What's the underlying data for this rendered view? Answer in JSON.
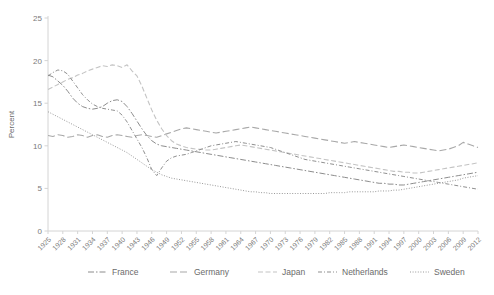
{
  "chart_data": {
    "type": "line",
    "title": "",
    "subtitle": "",
    "xlabel": "",
    "ylabel": "Percent",
    "ylim": [
      0,
      25
    ],
    "yticks": [
      0,
      5,
      10,
      15,
      20,
      25
    ],
    "xlim": [
      1925,
      2012
    ],
    "grid": false,
    "legend_position": "bottom",
    "x": [
      1925,
      1926,
      1927,
      1928,
      1929,
      1930,
      1931,
      1932,
      1933,
      1934,
      1935,
      1936,
      1937,
      1938,
      1939,
      1940,
      1941,
      1942,
      1943,
      1944,
      1945,
      1946,
      1947,
      1948,
      1949,
      1950,
      1951,
      1952,
      1953,
      1954,
      1955,
      1956,
      1957,
      1958,
      1959,
      1960,
      1961,
      1962,
      1963,
      1964,
      1965,
      1966,
      1967,
      1968,
      1969,
      1970,
      1971,
      1972,
      1973,
      1974,
      1975,
      1976,
      1977,
      1978,
      1979,
      1980,
      1981,
      1982,
      1983,
      1984,
      1985,
      1986,
      1987,
      1988,
      1989,
      1990,
      1991,
      1992,
      1993,
      1994,
      1995,
      1996,
      1997,
      1998,
      1999,
      2000,
      2001,
      2002,
      2003,
      2004,
      2005,
      2006,
      2007,
      2008,
      2009,
      2010,
      2011,
      2012
    ],
    "xtick_labels": [
      "1925",
      "1928",
      "1931",
      "1934",
      "1937",
      "1940",
      "1943",
      "1946",
      "1949",
      "1952",
      "1955",
      "1958",
      "1961",
      "1964",
      "1967",
      "1970",
      "1973",
      "1976",
      "1979",
      "1982",
      "1985",
      "1988",
      "1991",
      "1994",
      "1997",
      "2000",
      "2003",
      "2006",
      "2009",
      "2012"
    ],
    "series": [
      {
        "name": "France",
        "dash": "6,2,1.5,2",
        "color": "#8c8c8c",
        "width": 1.0,
        "values": [
          18.3,
          18.1,
          17.6,
          17.1,
          16.4,
          15.6,
          15.0,
          14.6,
          14.4,
          14.3,
          14.4,
          14.6,
          15.0,
          15.3,
          15.4,
          15.2,
          14.6,
          13.8,
          12.9,
          12.0,
          11.2,
          10.6,
          10.2,
          10.0,
          9.9,
          9.8,
          9.7,
          9.6,
          9.5,
          9.4,
          9.3,
          9.2,
          9.1,
          9.0,
          8.9,
          8.8,
          8.7,
          8.6,
          8.5,
          8.4,
          8.3,
          8.2,
          8.1,
          8.0,
          7.9,
          7.8,
          7.7,
          7.6,
          7.5,
          7.4,
          7.3,
          7.2,
          7.1,
          7.0,
          6.9,
          6.8,
          6.7,
          6.6,
          6.5,
          6.4,
          6.3,
          6.2,
          6.1,
          6.0,
          5.9,
          5.8,
          5.7,
          5.6,
          5.6,
          5.5,
          5.5,
          5.4,
          5.4,
          5.5,
          5.6,
          5.7,
          5.8,
          5.9,
          6.0,
          6.1,
          6.2,
          6.3,
          6.4,
          6.5,
          6.6,
          6.7,
          6.8,
          6.9
        ]
      },
      {
        "name": "Germany",
        "dash": "7,3",
        "color": "#a8a8a8",
        "width": 1.1,
        "values": [
          11.2,
          11.1,
          11.3,
          11.2,
          11.0,
          11.1,
          11.3,
          11.2,
          11.0,
          11.2,
          11.3,
          11.1,
          11.0,
          11.2,
          11.3,
          11.2,
          11.1,
          11.0,
          11.2,
          11.3,
          11.2,
          11.1,
          11.0,
          11.2,
          11.4,
          11.6,
          11.8,
          12.0,
          12.1,
          12.0,
          11.9,
          11.8,
          11.7,
          11.6,
          11.5,
          11.6,
          11.7,
          11.8,
          11.9,
          12.0,
          12.1,
          12.2,
          12.1,
          12.0,
          11.9,
          11.8,
          11.7,
          11.6,
          11.5,
          11.4,
          11.3,
          11.2,
          11.1,
          11.0,
          10.9,
          10.8,
          10.7,
          10.6,
          10.5,
          10.4,
          10.3,
          10.4,
          10.5,
          10.4,
          10.3,
          10.2,
          10.1,
          10.0,
          9.9,
          9.8,
          9.9,
          10.0,
          10.1,
          10.0,
          9.9,
          9.8,
          9.7,
          9.6,
          9.5,
          9.4,
          9.5,
          9.6,
          9.8,
          10.0,
          10.4,
          10.2,
          10.0,
          9.8
        ]
      },
      {
        "name": "Japan",
        "dash": "5,2.5",
        "color": "#c4c4c4",
        "width": 1.1,
        "values": [
          16.6,
          16.9,
          17.2,
          17.5,
          17.8,
          18.0,
          18.3,
          18.5,
          18.8,
          19.0,
          19.2,
          19.4,
          19.3,
          19.5,
          19.4,
          19.2,
          19.5,
          18.8,
          18.2,
          17.0,
          15.6,
          14.2,
          13.0,
          12.0,
          11.2,
          10.6,
          10.2,
          10.0,
          9.8,
          9.7,
          9.6,
          9.6,
          9.5,
          9.5,
          9.6,
          9.7,
          9.8,
          9.9,
          10.0,
          10.1,
          10.0,
          9.9,
          9.8,
          9.7,
          9.6,
          9.5,
          9.4,
          9.3,
          9.2,
          9.1,
          9.0,
          8.9,
          8.8,
          8.7,
          8.6,
          8.5,
          8.4,
          8.3,
          8.2,
          8.1,
          8.0,
          7.9,
          7.8,
          7.7,
          7.6,
          7.5,
          7.4,
          7.3,
          7.2,
          7.1,
          7.0,
          7.0,
          6.9,
          6.9,
          6.8,
          6.8,
          6.9,
          7.0,
          7.1,
          7.2,
          7.3,
          7.4,
          7.5,
          7.6,
          7.7,
          7.8,
          7.9,
          8.0
        ]
      },
      {
        "name": "Netherlands",
        "dash": "4,2,1,2",
        "color": "#8f8f8f",
        "width": 1.0,
        "values": [
          18.2,
          18.6,
          18.9,
          18.8,
          18.4,
          17.6,
          16.8,
          16.0,
          15.4,
          14.9,
          14.6,
          14.4,
          14.3,
          14.2,
          14.1,
          13.6,
          12.8,
          11.8,
          10.8,
          9.8,
          8.6,
          7.2,
          6.5,
          7.4,
          8.2,
          8.6,
          8.8,
          8.9,
          9.0,
          9.2,
          9.4,
          9.6,
          9.8,
          10.0,
          10.1,
          10.2,
          10.3,
          10.4,
          10.5,
          10.4,
          10.3,
          10.2,
          10.1,
          10.0,
          9.9,
          9.8,
          9.6,
          9.4,
          9.2,
          9.0,
          8.8,
          8.6,
          8.4,
          8.3,
          8.2,
          8.1,
          8.0,
          7.9,
          7.8,
          7.7,
          7.6,
          7.5,
          7.4,
          7.3,
          7.2,
          7.1,
          7.0,
          6.9,
          6.8,
          6.7,
          6.6,
          6.5,
          6.4,
          6.3,
          6.2,
          6.1,
          6.0,
          5.9,
          5.8,
          5.7,
          5.6,
          5.5,
          5.4,
          5.3,
          5.2,
          5.1,
          5.0,
          4.9
        ]
      },
      {
        "name": "Sweden",
        "dash": "1,1.6",
        "color": "#999999",
        "width": 1.0,
        "values": [
          14.0,
          13.7,
          13.4,
          13.1,
          12.8,
          12.5,
          12.2,
          11.9,
          11.6,
          11.3,
          11.0,
          10.7,
          10.4,
          10.1,
          9.8,
          9.5,
          9.2,
          8.8,
          8.4,
          8.0,
          7.6,
          7.2,
          6.9,
          6.6,
          6.4,
          6.2,
          6.1,
          6.0,
          5.9,
          5.8,
          5.7,
          5.6,
          5.5,
          5.4,
          5.3,
          5.2,
          5.1,
          5.0,
          4.9,
          4.8,
          4.7,
          4.6,
          4.6,
          4.5,
          4.5,
          4.4,
          4.4,
          4.4,
          4.4,
          4.4,
          4.4,
          4.4,
          4.4,
          4.4,
          4.4,
          4.4,
          4.4,
          4.5,
          4.5,
          4.5,
          4.5,
          4.6,
          4.6,
          4.6,
          4.6,
          4.6,
          4.6,
          4.7,
          4.7,
          4.7,
          4.8,
          4.8,
          4.9,
          5.0,
          5.1,
          5.2,
          5.3,
          5.4,
          5.5,
          5.6,
          5.7,
          5.8,
          5.9,
          6.0,
          6.2,
          6.3,
          6.4,
          6.5
        ]
      }
    ]
  },
  "legend": {
    "items": [
      {
        "label": "France"
      },
      {
        "label": "Germany"
      },
      {
        "label": "Japan"
      },
      {
        "label": "Netherlands"
      },
      {
        "label": "Sweden"
      }
    ]
  },
  "axis": {
    "y_title": "Percent"
  }
}
